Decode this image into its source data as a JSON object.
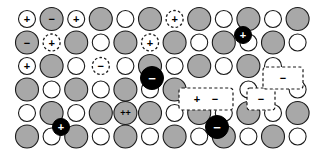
{
  "figure": {
    "width": 310,
    "height": 163,
    "background_color": "#ffffff"
  },
  "palette": {
    "anion_fill": "#a8a8a8",
    "anion_stroke": "#1a1a1a",
    "cation_fill": "#ffffff",
    "cation_stroke": "#1a1a1a",
    "interstitial_fill": "#000000",
    "interstitial_symbol_color": "#ffffff",
    "symbol_color": "#000000",
    "dashed_stroke": "#1a1a1a"
  },
  "geometry": {
    "col_spacing": 24.6,
    "row_spacing": 23.5,
    "x0": 27,
    "y0": 19,
    "large_radius": 11.5,
    "small_radius": 8.5
  },
  "legend_symbols": {
    "plus": "+",
    "minus": "−",
    "double_plus": "++"
  },
  "lattice": {
    "rows": 6,
    "cols": 11,
    "sites": [
      {
        "row": 0,
        "col": 0,
        "kind": "small",
        "symbol": "+",
        "dashed": false
      },
      {
        "row": 0,
        "col": 1,
        "kind": "large",
        "symbol": "−",
        "dashed": false
      },
      {
        "row": 0,
        "col": 2,
        "kind": "small",
        "symbol": "+",
        "dashed": false
      },
      {
        "row": 0,
        "col": 3,
        "kind": "large",
        "symbol": "",
        "dashed": false
      },
      {
        "row": 0,
        "col": 4,
        "kind": "small",
        "symbol": "",
        "dashed": false
      },
      {
        "row": 0,
        "col": 5,
        "kind": "large",
        "symbol": "",
        "dashed": false
      },
      {
        "row": 0,
        "col": 6,
        "kind": "small",
        "symbol": "+",
        "dashed": true
      },
      {
        "row": 0,
        "col": 7,
        "kind": "large",
        "symbol": "",
        "dashed": false
      },
      {
        "row": 0,
        "col": 8,
        "kind": "small",
        "symbol": "",
        "dashed": false
      },
      {
        "row": 0,
        "col": 9,
        "kind": "large",
        "symbol": "",
        "dashed": false
      },
      {
        "row": 0,
        "col": 10,
        "kind": "small",
        "symbol": "",
        "dashed": false
      },
      {
        "row": 0,
        "col": 11,
        "kind": "large",
        "symbol": "",
        "dashed": false
      },
      {
        "row": 1,
        "col": 0,
        "kind": "large",
        "symbol": "−",
        "dashed": false
      },
      {
        "row": 1,
        "col": 1,
        "kind": "small",
        "symbol": "+",
        "dashed": true
      },
      {
        "row": 1,
        "col": 2,
        "kind": "large",
        "symbol": "",
        "dashed": false
      },
      {
        "row": 1,
        "col": 3,
        "kind": "small",
        "symbol": "",
        "dashed": false
      },
      {
        "row": 1,
        "col": 4,
        "kind": "large",
        "symbol": "",
        "dashed": false
      },
      {
        "row": 1,
        "col": 5,
        "kind": "small",
        "symbol": "+",
        "dashed": true
      },
      {
        "row": 1,
        "col": 6,
        "kind": "large",
        "symbol": "",
        "dashed": false
      },
      {
        "row": 1,
        "col": 7,
        "kind": "small",
        "symbol": "",
        "dashed": false
      },
      {
        "row": 1,
        "col": 8,
        "kind": "large",
        "symbol": "",
        "dashed": false
      },
      {
        "row": 1,
        "col": 9,
        "kind": "small",
        "symbol": "",
        "dashed": false
      },
      {
        "row": 1,
        "col": 10,
        "kind": "large",
        "symbol": "",
        "dashed": false
      },
      {
        "row": 1,
        "col": 11,
        "kind": "small",
        "symbol": "",
        "dashed": false
      },
      {
        "row": 2,
        "col": 0,
        "kind": "small",
        "symbol": "+",
        "dashed": false
      },
      {
        "row": 2,
        "col": 1,
        "kind": "large",
        "symbol": "",
        "dashed": false
      },
      {
        "row": 2,
        "col": 2,
        "kind": "small",
        "symbol": "",
        "dashed": false
      },
      {
        "row": 2,
        "col": 3,
        "kind": "small",
        "symbol": "−",
        "dashed": true
      },
      {
        "row": 2,
        "col": 4,
        "kind": "small",
        "symbol": "",
        "dashed": false
      },
      {
        "row": 2,
        "col": 5,
        "kind": "large",
        "symbol": "",
        "dashed": false
      },
      {
        "row": 2,
        "col": 6,
        "kind": "small",
        "symbol": "",
        "dashed": false
      },
      {
        "row": 2,
        "col": 7,
        "kind": "large",
        "symbol": "",
        "dashed": false
      },
      {
        "row": 2,
        "col": 8,
        "kind": "small",
        "symbol": "",
        "dashed": false
      },
      {
        "row": 2,
        "col": 9,
        "kind": "large",
        "symbol": "",
        "dashed": false
      },
      {
        "row": 2,
        "col": 10,
        "kind": "small",
        "symbol": "",
        "dashed": false
      },
      {
        "row": 3,
        "col": 0,
        "kind": "large",
        "symbol": "",
        "dashed": false
      },
      {
        "row": 3,
        "col": 1,
        "kind": "small",
        "symbol": "",
        "dashed": false
      },
      {
        "row": 3,
        "col": 2,
        "kind": "large",
        "symbol": "",
        "dashed": false
      },
      {
        "row": 3,
        "col": 3,
        "kind": "small",
        "symbol": "",
        "dashed": false
      },
      {
        "row": 3,
        "col": 4,
        "kind": "large",
        "symbol": "",
        "dashed": false
      },
      {
        "row": 3,
        "col": 5,
        "kind": "small",
        "symbol": "",
        "dashed": false
      },
      {
        "row": 3,
        "col": 6,
        "kind": "large",
        "symbol": "",
        "dashed": false
      },
      {
        "row": 3,
        "col": 9,
        "kind": "small",
        "symbol": "",
        "dashed": false
      },
      {
        "row": 3,
        "col": 11,
        "kind": "small",
        "symbol": "",
        "dashed": false
      },
      {
        "row": 4,
        "col": 0,
        "kind": "small",
        "symbol": "",
        "dashed": false
      },
      {
        "row": 4,
        "col": 1,
        "kind": "large",
        "symbol": "",
        "dashed": false
      },
      {
        "row": 4,
        "col": 2,
        "kind": "small",
        "symbol": "",
        "dashed": false
      },
      {
        "row": 4,
        "col": 3,
        "kind": "large",
        "symbol": "",
        "dashed": false
      },
      {
        "row": 4,
        "col": 4,
        "kind": "large",
        "symbol": "++",
        "dashed": false
      },
      {
        "row": 4,
        "col": 5,
        "kind": "large",
        "symbol": "",
        "dashed": false
      },
      {
        "row": 4,
        "col": 6,
        "kind": "small",
        "symbol": "",
        "dashed": false
      },
      {
        "row": 4,
        "col": 7,
        "kind": "large",
        "symbol": "",
        "dashed": false
      },
      {
        "row": 4,
        "col": 8,
        "kind": "small",
        "symbol": "",
        "dashed": false
      },
      {
        "row": 4,
        "col": 9,
        "kind": "large",
        "symbol": "",
        "dashed": false
      },
      {
        "row": 4,
        "col": 10,
        "kind": "small",
        "symbol": "",
        "dashed": false
      },
      {
        "row": 4,
        "col": 11,
        "kind": "large",
        "symbol": "",
        "dashed": false
      },
      {
        "row": 5,
        "col": 0,
        "kind": "large",
        "symbol": "",
        "dashed": false
      },
      {
        "row": 5,
        "col": 1,
        "kind": "small",
        "symbol": "",
        "dashed": false
      },
      {
        "row": 5,
        "col": 2,
        "kind": "large",
        "symbol": "",
        "dashed": false
      },
      {
        "row": 5,
        "col": 3,
        "kind": "small",
        "symbol": "",
        "dashed": false
      },
      {
        "row": 5,
        "col": 4,
        "kind": "large",
        "symbol": "",
        "dashed": false
      },
      {
        "row": 5,
        "col": 5,
        "kind": "small",
        "symbol": "",
        "dashed": false
      },
      {
        "row": 5,
        "col": 6,
        "kind": "large",
        "symbol": "",
        "dashed": false
      },
      {
        "row": 5,
        "col": 7,
        "kind": "small",
        "symbol": "",
        "dashed": false
      },
      {
        "row": 5,
        "col": 8,
        "kind": "large",
        "symbol": "",
        "dashed": false
      },
      {
        "row": 5,
        "col": 9,
        "kind": "small",
        "symbol": "",
        "dashed": false
      },
      {
        "row": 5,
        "col": 10,
        "kind": "large",
        "symbol": "",
        "dashed": false
      },
      {
        "row": 5,
        "col": 11,
        "kind": "small",
        "symbol": "",
        "dashed": false
      }
    ],
    "interstitials": [
      {
        "cx": 243,
        "cy": 35,
        "r": 8.5,
        "symbol": "+",
        "name": "interstitial-cation-top-right"
      },
      {
        "cx": 152,
        "cy": 78,
        "r": 11.5,
        "symbol": "−",
        "name": "interstitial-anion-center"
      },
      {
        "cx": 61,
        "cy": 127,
        "r": 8.5,
        "symbol": "+",
        "name": "interstitial-cation-lower-left"
      },
      {
        "cx": 217,
        "cy": 127,
        "r": 11.5,
        "symbol": "−",
        "name": "interstitial-anion-lower-right"
      }
    ],
    "vacancy_boxes": [
      {
        "x": 179,
        "y": 88,
        "w": 54,
        "h": 22,
        "symbols": [
          "+",
          "−"
        ],
        "name": "schottky-pair-vacancy-box"
      },
      {
        "x": 247,
        "y": 88,
        "w": 28,
        "h": 22,
        "symbols": [
          "−"
        ],
        "name": "anion-vacancy-box"
      },
      {
        "x": 263,
        "y": 67,
        "w": 40,
        "h": 22,
        "symbols": [
          "−"
        ],
        "name": "anion-vacancy-box-upper-right"
      }
    ]
  }
}
